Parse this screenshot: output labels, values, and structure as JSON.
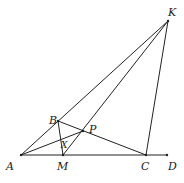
{
  "diagram": {
    "points": [
      {
        "id": "A",
        "label": "A",
        "x": 21,
        "y": 155,
        "lx": 6,
        "ly": 170
      },
      {
        "id": "B",
        "label": "B",
        "x": 58,
        "y": 121,
        "lx": 49,
        "ly": 124
      },
      {
        "id": "P",
        "label": "P",
        "x": 83,
        "y": 131,
        "lx": 89,
        "ly": 133
      },
      {
        "id": "X",
        "label": "X",
        "x": 62,
        "y": 141,
        "lx": 61,
        "ly": 148
      },
      {
        "id": "M",
        "label": "M",
        "x": 63,
        "y": 155,
        "lx": 57,
        "ly": 170
      },
      {
        "id": "C",
        "label": "C",
        "x": 146,
        "y": 155,
        "lx": 141,
        "ly": 170
      },
      {
        "id": "D",
        "label": "D",
        "x": 167,
        "y": 155,
        "lx": 168,
        "ly": 170
      },
      {
        "id": "K",
        "label": "K",
        "x": 168,
        "y": 21,
        "lx": 168,
        "ly": 16
      }
    ],
    "segments": [
      [
        "A",
        "K"
      ],
      [
        "A",
        "D"
      ],
      [
        "B",
        "C"
      ],
      [
        "B",
        "M"
      ],
      [
        "A",
        "P"
      ],
      [
        "M",
        "K"
      ],
      [
        "C",
        "K"
      ]
    ]
  }
}
